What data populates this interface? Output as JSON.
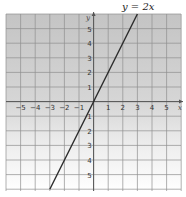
{
  "chart_data": {
    "type": "line",
    "title": "y = 2x",
    "xlabel": "x",
    "ylabel": "y",
    "xlim": [
      -6,
      6
    ],
    "ylim": [
      -6,
      6
    ],
    "grid": true,
    "x_ticks": [
      "−5",
      "−4",
      "−3",
      "−2",
      "−1",
      "1",
      "2",
      "3",
      "4",
      "5"
    ],
    "y_ticks": [
      "5",
      "4",
      "3",
      "2",
      "1",
      "1",
      "2",
      "3",
      "4",
      "5"
    ],
    "series": [
      {
        "name": "y = 2x",
        "x": [
          -3,
          3
        ],
        "y": [
          -6,
          6
        ]
      }
    ]
  },
  "labels": {
    "title": "y = 2x",
    "x_axis": "x",
    "y_axis": "y"
  },
  "colors": {
    "grid": "#8a8a8a",
    "fill_top": "#c8c8c8",
    "fill_bottom": "#ffffff",
    "line": "#2b2b2b"
  }
}
